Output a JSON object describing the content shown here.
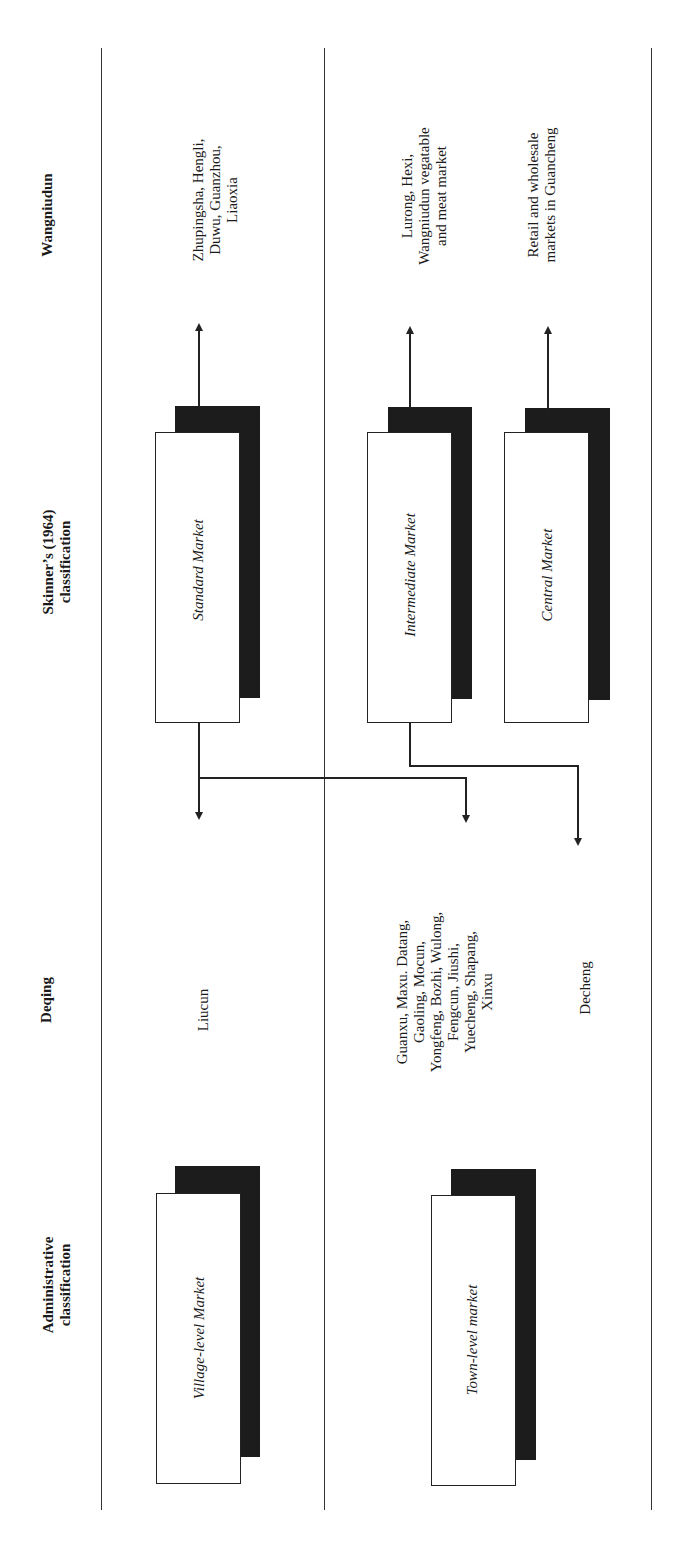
{
  "headers": {
    "administrative": "Administrative\nclassification",
    "deqing": "Deqing",
    "skinner": "Skinner’s (1964)\nclassification",
    "wangniudun": "Wangniudun"
  },
  "boxes": {
    "village": "Village-level Market",
    "town": "Town-level market",
    "standard": "Standard Market",
    "intermediate": "Intermediate Market",
    "central": "Central Market"
  },
  "deqing_markets": {
    "village_row": "Liucun",
    "town_row": "Guanxu, Maxu. Datang,\nGaoling, Mocun,\nYongfeng, Bozhi, Wulong,\nFengcun, Jiushi,\nYuecheng, Shapang,\nXinxu",
    "town_central": "Decheng"
  },
  "wangniudun_markets": {
    "standard": "Zhupingsha, Hengli,\nDuwu, Guanzhou,\nLiaoxia",
    "intermediate": "Lurong, Hexi,\nWangniudun vegatable\nand meat market",
    "central": "Retail and wholesale\nmarkets in Guancheng"
  }
}
